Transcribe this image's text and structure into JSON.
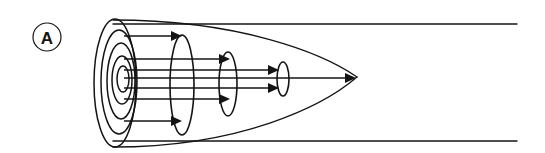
{
  "figure": {
    "panel_label": "A",
    "background_color": "#ffffff",
    "stroke_color": "#141414",
    "width": 545,
    "height": 153
  },
  "panel_badge": {
    "label": "A",
    "shape": "circle",
    "center_x": 47,
    "center_y": 37,
    "radius": 14,
    "stroke_width": 1.2
  },
  "chart_data": {
    "type": "diagram",
    "title": "",
    "subtitle": "",
    "xlabel": "",
    "ylabel": "",
    "apex": {
      "x": 357,
      "y": 77
    },
    "axis_y": 77,
    "envelope": {
      "name": "outer-parabolic-envelope",
      "left_x": 113,
      "apex_x": 357,
      "top_y_at_left": 20,
      "bottom_y_at_left": 147,
      "stroke_width": 1.3
    },
    "boundary_lines": [
      {
        "name": "top-boundary-line",
        "x1": 113,
        "y1": 24,
        "x2": 517,
        "y2": 24,
        "stroke_width": 1.4
      },
      {
        "name": "bottom-boundary-line",
        "x1": 113,
        "y1": 141,
        "x2": 517,
        "y2": 141,
        "stroke_width": 1.4
      }
    ],
    "cross_sections": [
      {
        "name": "cross-section-1",
        "cx": 115,
        "cy": 83,
        "rx": 21,
        "ry": 64,
        "stroke_width": 1.5
      },
      {
        "name": "cross-section-2",
        "cx": 119,
        "cy": 82,
        "rx": 18,
        "ry": 52,
        "stroke_width": 1.5
      },
      {
        "name": "cross-section-3",
        "cx": 121,
        "cy": 81,
        "rx": 14,
        "ry": 38,
        "stroke_width": 1.5
      },
      {
        "name": "cross-section-4",
        "cx": 122,
        "cy": 80,
        "rx": 10,
        "ry": 24,
        "stroke_width": 1.5
      },
      {
        "name": "cross-section-5",
        "cx": 123,
        "cy": 79,
        "rx": 6,
        "ry": 13,
        "stroke_width": 1.5
      },
      {
        "name": "cross-section-6",
        "cx": 182,
        "cy": 85,
        "rx": 12,
        "ry": 50,
        "stroke_width": 1.6
      },
      {
        "name": "cross-section-7",
        "cx": 228,
        "cy": 84,
        "rx": 9,
        "ry": 32,
        "stroke_width": 1.6
      },
      {
        "name": "cross-section-8",
        "cx": 283,
        "cy": 79,
        "rx": 6,
        "ry": 17,
        "stroke_width": 1.6
      }
    ],
    "flow_arrows": [
      {
        "name": "flow-arrow-1",
        "x1": 124,
        "y1": 36,
        "x2": 182,
        "y2": 36,
        "head_length": 11,
        "head_half_width": 5
      },
      {
        "name": "flow-arrow-2",
        "x1": 124,
        "y1": 59,
        "x2": 230,
        "y2": 59,
        "head_length": 11,
        "head_half_width": 5
      },
      {
        "name": "flow-arrow-3",
        "x1": 124,
        "y1": 70,
        "x2": 279,
        "y2": 70,
        "head_length": 11,
        "head_half_width": 5
      },
      {
        "name": "flow-arrow-4",
        "x1": 124,
        "y1": 78,
        "x2": 356,
        "y2": 78,
        "head_length": 11,
        "head_half_width": 5
      },
      {
        "name": "flow-arrow-5",
        "x1": 124,
        "y1": 88,
        "x2": 279,
        "y2": 88,
        "head_length": 11,
        "head_half_width": 5
      },
      {
        "name": "flow-arrow-6",
        "x1": 124,
        "y1": 99,
        "x2": 230,
        "y2": 99,
        "head_length": 11,
        "head_half_width": 5
      },
      {
        "name": "flow-arrow-7",
        "x1": 124,
        "y1": 121,
        "x2": 182,
        "y2": 121,
        "head_length": 11,
        "head_half_width": 5
      }
    ]
  }
}
